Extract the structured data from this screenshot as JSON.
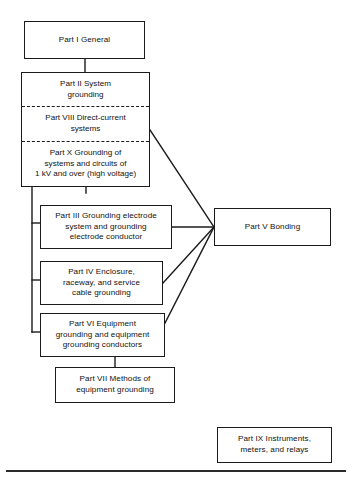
{
  "diagram": {
    "type": "flowchart",
    "nodes": [
      {
        "id": "part1",
        "data_name": "node-part-i-general",
        "text": "Part I General",
        "x": 24,
        "y": 21,
        "w": 121,
        "h": 38
      },
      {
        "id": "part3",
        "data_name": "node-part-iii-grounding-electrode",
        "text": "Part III Grounding electrode\nsystem and grounding\nelectrode conductor",
        "x": 40,
        "y": 205,
        "w": 132,
        "h": 44
      },
      {
        "id": "part4",
        "data_name": "node-part-iv-enclosure",
        "text": "Part IV Enclosure,\nraceway, and service\ncable grounding",
        "x": 40,
        "y": 261,
        "w": 123,
        "h": 44
      },
      {
        "id": "part6",
        "data_name": "node-part-vi-equipment-grounding",
        "text": "Part VI Equipment\ngrounding and equipment\ngrounding conductors",
        "x": 40,
        "y": 313,
        "w": 125,
        "h": 44
      },
      {
        "id": "part7",
        "data_name": "node-part-vii-methods",
        "text": "Part VII Methods of\nequipment grounding",
        "x": 55,
        "y": 367,
        "w": 120,
        "h": 36
      },
      {
        "id": "part5",
        "data_name": "node-part-v-bonding",
        "text": "Part V Bonding",
        "x": 214,
        "y": 208,
        "w": 117,
        "h": 38
      },
      {
        "id": "part9",
        "data_name": "node-part-ix-instruments",
        "text": "Part IX Instruments,\nmeters, and relays",
        "x": 217,
        "y": 427,
        "w": 115,
        "h": 36
      }
    ],
    "composite": {
      "data_name": "node-system-grounding-group",
      "x": 21,
      "y": 72,
      "w": 129,
      "h": 115,
      "segments": [
        {
          "id": "part2",
          "data_name": "segment-part-ii-system-grounding",
          "text": "Part II System\ngrounding",
          "divider_above": false
        },
        {
          "id": "part8",
          "data_name": "segment-part-viii-direct-current",
          "text": "Part VIII Direct-current\nsystems",
          "divider_above": true
        },
        {
          "id": "part10",
          "data_name": "segment-part-x-high-voltage",
          "text": "Part X Grounding of\nsystems and circuits of\n1 kV and over (high voltage)",
          "divider_above": true
        }
      ]
    },
    "connectors": [
      {
        "name": "connector-part-i-to-part-ii",
        "d": "M 85 59 L 85 72"
      },
      {
        "name": "connector-spine-vertical",
        "d": "M 32 187 L 32 332"
      },
      {
        "name": "connector-part-x-down-to-spine",
        "d": "M 86 187 L 86 193"
      },
      {
        "name": "connector-spine-stub-part-iii",
        "d": "M 32 223 L 40 223"
      },
      {
        "name": "connector-spine-stub-part-iv",
        "d": "M 32 280 L 40 280"
      },
      {
        "name": "connector-spine-stub-part-vi",
        "d": "M 32 332 L 40 332"
      },
      {
        "name": "connector-part-vi-to-part-vii",
        "d": "M 115 357 L 115 367"
      },
      {
        "name": "connector-part-viii-to-part-v",
        "d": "M 150 130 L 214 227"
      },
      {
        "name": "connector-part-iii-to-part-v",
        "d": "M 172 227 L 214 227"
      },
      {
        "name": "connector-part-iv-to-part-v",
        "d": "M 163 283 L 214 227"
      },
      {
        "name": "connector-part-vi-to-part-v",
        "d": "M 165 323 L 214 227"
      }
    ],
    "footer_rule": {
      "name": "footer-rule",
      "x": 6,
      "y": 470,
      "w": 340,
      "h": 1.6
    },
    "colors": {
      "stroke": "#1b1b1b",
      "text": "#111111",
      "background": "#ffffff",
      "rule": "#2b2b2b"
    }
  }
}
